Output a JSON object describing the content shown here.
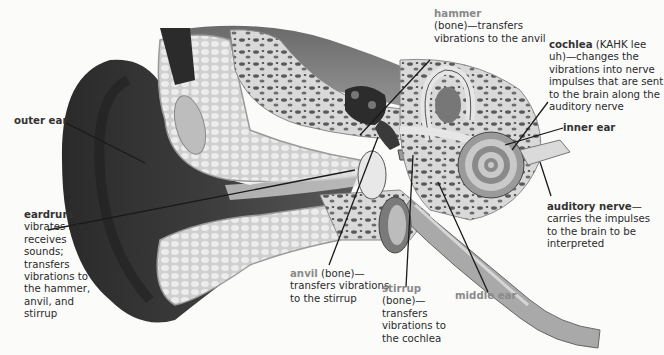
{
  "diagram": {
    "style": "grayscale anatomical illustration",
    "colors": {
      "background": "#fbfbfa",
      "label_text": "#2a2a2a",
      "term_dark": "#333333",
      "term_gray": "#8a8a8a",
      "leader_line": "#1a1a1a"
    }
  },
  "labels": {
    "hammer": {
      "term": "hammer",
      "desc": "(bone)—transfers vibrations to the anvil"
    },
    "cochlea": {
      "term": "cochlea",
      "desc": " (KAHK lee uh)—changes the vibrations into nerve impulses that are sent to the brain along the auditory nerve"
    },
    "outer_ear": {
      "term": "outer ear"
    },
    "inner_ear": {
      "term": "inner ear"
    },
    "eardrum": {
      "term": "eardrum",
      "dash": "—",
      "desc": "vibrates as it receives sounds; transfers vibrations to the hammer, anvil, and stirrup"
    },
    "auditory_nerve": {
      "term": "auditory nerve",
      "dash": "—",
      "desc": "carries the impulses to the brain to be interpreted"
    },
    "anvil": {
      "term": "anvil",
      "desc": " (bone)—transfers vibrations to the stirrup"
    },
    "stirrup": {
      "term": "stirrup",
      "desc": "(bone)—transfers vibrations to the cochlea"
    },
    "middle_ear": {
      "term": "middle ear"
    }
  }
}
